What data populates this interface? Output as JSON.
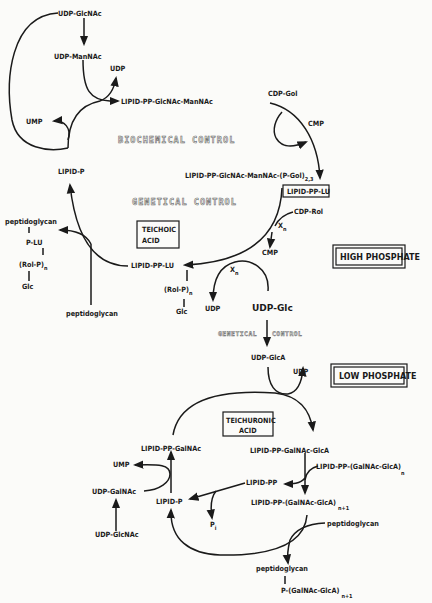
{
  "diagram": {
    "title_regions": {
      "high": "HIGH PHOSPHATE",
      "low": "LOW PHOSPHATE"
    },
    "controls": {
      "biochemical": "BIOCHEMICAL CONTROL",
      "genetical": "GENETICAL CONTROL",
      "genetical_left": "GENETICAL",
      "genetical_right": "CONTROL"
    },
    "boxes": {
      "teichoic": [
        "TEICHOIC",
        "ACID"
      ],
      "teichuronic": [
        "TEICHURONIC",
        "ACID"
      ],
      "lipid_pp_lu": "LIPID-PP-LU"
    },
    "upper_cycle": {
      "udp_glcnac": "UDP-GlcNAc",
      "udp_mannac": "UDP-ManNAc",
      "udp_1": "UDP",
      "lipid_pp_glcnac_mannac": "LIPID-PP-GlcNAc-ManNAc",
      "ump": "UMP",
      "cdp_gol": "CDP-Gol",
      "cmp_1": "CMP",
      "lipid_p": "LIPID-P",
      "lipid_pp_glcnac_mannac_pgol": "LIPID-PP-GlcNAc-ManNAc-(P-Gol)",
      "pgol_sub": "2,3",
      "cdp_rol": "CDP-Rol",
      "x": "X",
      "x_sub": "n",
      "cmp_2": "CMP",
      "lipid_pp_lu": "LIPID-PP-LU",
      "rol_p": "(Rol-P)",
      "rol_p_sub": "n",
      "glc": "Glc",
      "udp_2": "UDP",
      "udp_glc": "UDP-Glc",
      "peptidoglycan_in": "peptidoglycan",
      "product": {
        "peptidoglycan": "peptidoglycan",
        "p_lu": "P-LU",
        "rol_p": "(Rol-P)",
        "rol_p_sub": "n",
        "glc": "Glc"
      }
    },
    "middle": {
      "udp_glca": "UDP-GlcA",
      "udp": "UDP"
    },
    "lower_cycle": {
      "lipid_pp_galnac": "LIPID-PP-GalNAc",
      "ump": "UMP",
      "udp_galnac": "UDP-GalNAc",
      "udp_glcnac": "UDP-GlcNAc",
      "lipid_p": "LIPID-P",
      "pi": "P",
      "pi_sub": "i",
      "lipid_pp_galnac_glca": "LIPID-PP-GalNAc-GlcA",
      "lipid_pp_polymer_n": "LIPID-PP-(GalNAc-GlcA)",
      "n_sub": "n",
      "lipid_pp": "LIPID-PP",
      "lipid_pp_polymer_n1": "LIPID-PP-(GalNAc-GlcA)",
      "n1_sub": "n+1",
      "peptidoglycan_in": "peptidoglycan",
      "product": {
        "peptidoglycan": "peptidoglycan",
        "p_polymer": "P-(GalNAc-GlcA)",
        "sub": "n+1"
      }
    }
  }
}
